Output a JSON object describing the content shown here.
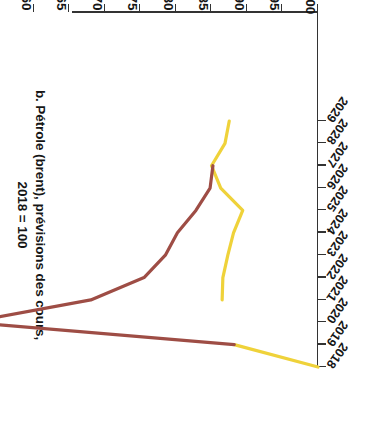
{
  "figure": {
    "title_line1": "b. Pétrole (brent), prévisions des cours,",
    "title_line2": "2018 = 100",
    "orientation": "rotated-180"
  },
  "axes": {
    "y_axis_title": "Prix indexé 2018 = 100",
    "y_ticks": [
      "50",
      "55",
      "60",
      "65",
      "70",
      "75",
      "80",
      "85",
      "90",
      "95",
      "100"
    ],
    "x_ticks": [
      "2018",
      "2019",
      "2020",
      "2021",
      "2022",
      "2023",
      "2024",
      "2025",
      "2026",
      "2027",
      "2028",
      "2029"
    ]
  },
  "colors": {
    "series_yellow": "#EFD23A",
    "series_red": "#9E4D45",
    "axis": "#333333",
    "text": "#161616",
    "background": "#FFFFFF"
  },
  "chart_data": {
    "type": "line",
    "title": "b. Pétrole (brent), prévisions des cours, 2018 = 100",
    "xlabel": "",
    "ylabel": "Prix indexé 2018 = 100",
    "x": [
      2018,
      2019,
      2020,
      2021,
      2022,
      2023,
      2024,
      2025,
      2026,
      2027,
      2028,
      2029
    ],
    "xlim": [
      2018,
      2029
    ],
    "ylim": [
      50,
      100
    ],
    "grid": false,
    "legend": "none",
    "series": [
      {
        "name": "Prévision antérieure",
        "color": "#EFD23A",
        "values": [
          100,
          88.2,
          null,
          86.5,
          86.6,
          87.3,
          88.1,
          89.4,
          86.3,
          85.0,
          86.9,
          87.5
        ]
      },
      {
        "name": "Prévision actuelle",
        "color": "#9E4D45",
        "values": [
          null,
          88.2,
          51.0,
          68.0,
          75.5,
          78.5,
          80.2,
          82.8,
          84.8,
          85.2,
          null,
          null
        ]
      }
    ]
  }
}
